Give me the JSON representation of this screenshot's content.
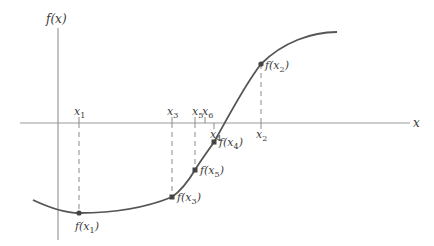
{
  "diagram": {
    "type": "function-root-finding",
    "axes": {
      "x_label": "x",
      "y_label": "f(x)"
    },
    "x_points": [
      {
        "id": "x1",
        "base": "x",
        "sub": "1",
        "x": 79
      },
      {
        "id": "x3",
        "base": "x",
        "sub": "3",
        "x": 172
      },
      {
        "id": "x5",
        "base": "x",
        "sub": "5",
        "x": 195
      },
      {
        "id": "x6",
        "base": "x",
        "sub": "6",
        "x": 205
      },
      {
        "id": "x4",
        "base": "x",
        "sub": "4",
        "x": 214
      },
      {
        "id": "x2",
        "base": "x",
        "sub": "2",
        "x": 261
      }
    ],
    "f_points": [
      {
        "id": "fx1",
        "text": "f(x",
        "sub": "1",
        "close": ")",
        "x": 79,
        "y": 213
      },
      {
        "id": "fx3",
        "text": "f(x",
        "sub": "3",
        "close": ")",
        "x": 172,
        "y": 197
      },
      {
        "id": "fx5",
        "text": "f(x",
        "sub": "5",
        "close": ")",
        "x": 195,
        "y": 170
      },
      {
        "id": "fx4",
        "text": "f(x",
        "sub": "4",
        "close": ")",
        "x": 214,
        "y": 142
      },
      {
        "id": "fx2",
        "text": "f(x",
        "sub": "2",
        "close": ")",
        "x": 261,
        "y": 64
      }
    ],
    "colors": {
      "curve": "#555555",
      "axis": "#9a9a9a",
      "dash": "#8a8a8a",
      "point": "#444444",
      "text": "#3a3a3a"
    }
  }
}
